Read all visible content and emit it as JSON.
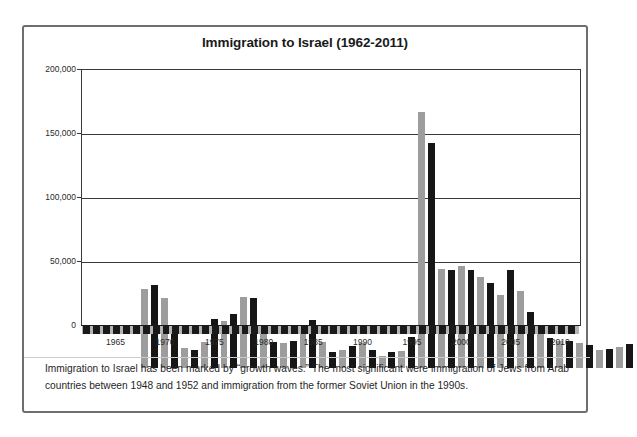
{
  "chart_data": {
    "type": "bar",
    "title": "Immigration to Israel (1962-2011)",
    "xlabel": "",
    "ylabel": "",
    "ylim": [
      0,
      200000
    ],
    "yticks": [
      0,
      50000,
      100000,
      150000,
      200000
    ],
    "ytick_labels": [
      "0",
      "50,000",
      "100,000",
      "150,000",
      "200,000"
    ],
    "xtick_labels": [
      "1965",
      "1970",
      "1975",
      "1980",
      "1985",
      "1990",
      "1995",
      "2000",
      "2005",
      "2010"
    ],
    "grid": true,
    "legend": "none",
    "note": "Bars alternate gray and black by year for visual separation; 1990 bar is clipped at the top of the axis.",
    "colors": {
      "gray_bar": "#9d9d9d",
      "black_bar": "#161616",
      "axis": "#3a3a3a",
      "frame": "#6e6e6e"
    },
    "categories": [
      1962,
      1963,
      1964,
      1965,
      1966,
      1967,
      1968,
      1969,
      1970,
      1971,
      1972,
      1973,
      1974,
      1975,
      1976,
      1977,
      1978,
      1979,
      1980,
      1981,
      1982,
      1983,
      1984,
      1985,
      1986,
      1987,
      1988,
      1989,
      1990,
      1991,
      1992,
      1993,
      1994,
      1995,
      1996,
      1997,
      1998,
      1999,
      2000,
      2001,
      2002,
      2003,
      2004,
      2005,
      2006,
      2007,
      2008,
      2009,
      2010,
      2011
    ],
    "values": [
      61500,
      64500,
      54800,
      30800,
      15300,
      14300,
      20700,
      38100,
      36800,
      41900,
      55800,
      54900,
      31900,
      20000,
      19800,
      21400,
      26400,
      37200,
      20400,
      12600,
      13700,
      16900,
      19900,
      13700,
      9500,
      12900,
      13000,
      24000,
      200000,
      176100,
      77100,
      76800,
      79800,
      76400,
      70900,
      66200,
      56700,
      76800,
      60200,
      43600,
      33600,
      23300,
      20900,
      21200,
      19300,
      18100,
      13700,
      14600,
      16600,
      19000
    ],
    "bar_colors": [
      "gray",
      "black",
      "gray",
      "black",
      "gray",
      "black",
      "gray",
      "black",
      "gray",
      "black",
      "gray",
      "black",
      "gray",
      "black",
      "gray",
      "black",
      "gray",
      "black",
      "gray",
      "black",
      "gray",
      "black",
      "gray",
      "black",
      "gray",
      "black",
      "gray",
      "black",
      "gray",
      "black",
      "gray",
      "black",
      "gray",
      "black",
      "gray",
      "black",
      "gray",
      "black",
      "gray",
      "black",
      "gray",
      "black",
      "gray",
      "black",
      "gray",
      "black",
      "gray",
      "black",
      "gray",
      "black"
    ]
  },
  "caption": {
    "text": "Immigration to Israel has been marked by “growth waves.” The most significant were immigration of Jews from Arab countries between 1948 and 1952 and immigration from the former Soviet Union in the 1990s."
  }
}
